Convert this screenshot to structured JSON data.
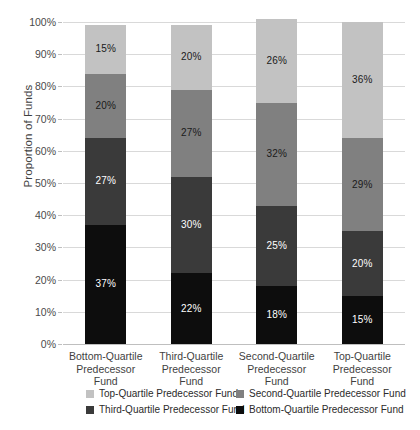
{
  "chart_data": {
    "type": "bar",
    "subtype": "stacked-bar-100-percent",
    "title": "",
    "xlabel": "",
    "ylabel": "Proportion of Funds",
    "ylim": [
      0,
      100
    ],
    "grid": true,
    "legend_position": "bottom",
    "categories": [
      "Bottom-Quartile Predecessor Fund",
      "Third-Quartile Predecessor Fund",
      "Second-Quartile Predecessor Fund",
      "Top-Quartile Predecessor Fund"
    ],
    "category_lines": [
      [
        "Bottom-Quartile",
        "Predecessor Fund"
      ],
      [
        "Third-Quartile",
        "Predecessor Fund"
      ],
      [
        "Second-Quartile",
        "Predecessor Fund"
      ],
      [
        "Top-Quartile",
        "Predecessor Fund"
      ]
    ],
    "ticks": [
      "0%",
      "10%",
      "20%",
      "30%",
      "40%",
      "50%",
      "60%",
      "70%",
      "80%",
      "90%",
      "100%"
    ],
    "tick_values": [
      0,
      10,
      20,
      30,
      40,
      50,
      60,
      70,
      80,
      90,
      100
    ],
    "series": [
      {
        "name": "Bottom-Quartile Predecessor Fund",
        "color": "#0d0d0d",
        "label_color": "#ffffff",
        "values": [
          37,
          22,
          18,
          15
        ],
        "labels": [
          "37%",
          "22%",
          "18%",
          "15%"
        ]
      },
      {
        "name": "Third-Quartile Predecessor Fund",
        "color": "#3a3a3a",
        "label_color": "#ffffff",
        "values": [
          27,
          30,
          25,
          20
        ],
        "labels": [
          "27%",
          "30%",
          "25%",
          "20%"
        ]
      },
      {
        "name": "Second-Quartile Predecessor Fund",
        "color": "#808080",
        "label_color": "#1a1a1a",
        "values": [
          20,
          27,
          32,
          29
        ],
        "labels": [
          "20%",
          "27%",
          "32%",
          "29%"
        ]
      },
      {
        "name": "Top-Quartile Predecessor Fund",
        "color": "#c2c2c2",
        "label_color": "#1a1a1a",
        "values": [
          15,
          20,
          26,
          36
        ],
        "labels": [
          "15%",
          "20%",
          "26%",
          "36%"
        ]
      }
    ],
    "legend": [
      {
        "label": "Top-Quartile Predecessor Fund",
        "color": "#c2c2c2"
      },
      {
        "label": "Second-Quartile Predecessor Fund",
        "color": "#808080"
      },
      {
        "label": "Third-Quartile Predecessor Fund",
        "color": "#3a3a3a"
      },
      {
        "label": "Bottom-Quartile Predecessor Fund",
        "color": "#0d0d0d"
      }
    ],
    "colors": {
      "gridline": "#d9d9d9",
      "axis": "#bfbfbf",
      "background": "#ffffff",
      "text": "#3f3f3f"
    }
  }
}
